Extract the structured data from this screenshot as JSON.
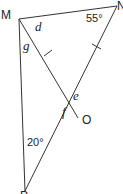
{
  "diagram": {
    "type": "geometry-triangle",
    "points": {
      "M": {
        "label": "M",
        "x": 19,
        "y": 19
      },
      "N": {
        "label": "N",
        "x": 117,
        "y": 6
      },
      "P": {
        "label": "P",
        "x": 25,
        "y": 191
      },
      "O": {
        "label": "O",
        "x": 78,
        "y": 118
      }
    },
    "segments": [
      {
        "from": "M",
        "to": "N"
      },
      {
        "from": "N",
        "to": "P"
      },
      {
        "from": "M",
        "to": "P"
      },
      {
        "from": "M",
        "to": "O"
      }
    ],
    "equal_marks": [
      "MO",
      "NO"
    ],
    "angle_labels": {
      "d": "d",
      "g": "g",
      "e": "e",
      "f": "f",
      "N": "55°",
      "P": "20°"
    }
  }
}
